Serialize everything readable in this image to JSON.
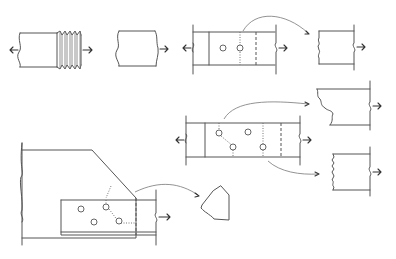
{
  "figure": {
    "type": "engineering-diagram",
    "background": "#ffffff",
    "line_color": "#555555",
    "panels": [
      {
        "id": "threaded-rod",
        "description": "threaded rod under tension, arrows pulling both ends",
        "x": 8,
        "y": 33,
        "w": 90,
        "h": 40
      },
      {
        "id": "fractured-rod",
        "description": "rod fractured at thread root, arrow to right",
        "x": 113,
        "y": 30,
        "w": 57,
        "h": 40
      },
      {
        "id": "bolted-plate-two-holes",
        "description": "plate with two bolt holes; net-section rupture line dotted through hole, dashed gusset edge",
        "x": 190,
        "y": 30,
        "w": 100,
        "h": 40
      },
      {
        "id": "plate-net-section-piece",
        "description": "ruptured plate piece with jagged left edge",
        "x": 318,
        "y": 30,
        "w": 60,
        "h": 38
      },
      {
        "id": "bolted-plate-four-holes",
        "description": "plate with four staggered holes and two possible rupture paths",
        "x": 185,
        "y": 118,
        "w": 115,
        "h": 40
      },
      {
        "id": "staggered-rupture-piece",
        "description": "piece ruptured along staggered zig-zag path",
        "x": 315,
        "y": 87,
        "w": 60,
        "h": 36
      },
      {
        "id": "straight-rupture-piece",
        "description": "piece ruptured along straight path",
        "x": 330,
        "y": 150,
        "w": 45,
        "h": 36
      },
      {
        "id": "gusset-block-shear",
        "description": "angle bolted to gusset plate with block shear tear-out path",
        "x": 20,
        "y": 145,
        "w": 140,
        "h": 100
      },
      {
        "id": "block-shear-piece",
        "description": "tear-out block removed from gusset plate",
        "x": 200,
        "y": 186,
        "w": 32,
        "h": 35
      }
    ],
    "arrows": [
      {
        "id": "tension-left-1",
        "direction": "left"
      },
      {
        "id": "tension-right-1",
        "direction": "right"
      },
      {
        "id": "curved-arrow-top",
        "from": "bolted-plate-two-holes",
        "to": "plate-net-section-piece"
      },
      {
        "id": "curved-arrow-mid-top",
        "from": "bolted-plate-four-holes",
        "to": "staggered-rupture-piece"
      },
      {
        "id": "curved-arrow-mid-bottom",
        "from": "bolted-plate-four-holes",
        "to": "straight-rupture-piece"
      },
      {
        "id": "curved-arrow-bottom",
        "from": "gusset-block-shear",
        "to": "block-shear-piece"
      }
    ]
  }
}
